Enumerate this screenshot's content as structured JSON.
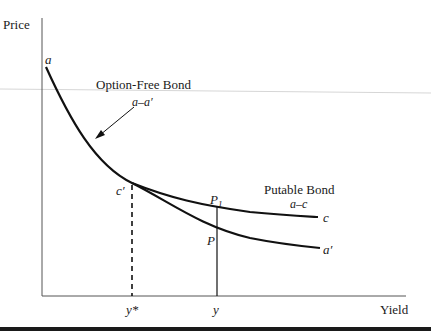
{
  "axes": {
    "y_label": "Price",
    "x_label": "Yield"
  },
  "points": {
    "a": "a",
    "a_prime": "a′",
    "c": "c",
    "c_prime": "c′",
    "p1_main": "P",
    "p1_sub": "1",
    "p": "P",
    "y_star": "y*",
    "y": "y"
  },
  "labels": {
    "option_free_title": "Option-Free Bond",
    "option_free_range": "a–a′",
    "putable_title": "Putable Bond",
    "putable_range": "a–c"
  },
  "colors": {
    "curve": "#111111",
    "axis": "#555555",
    "rule": "#1a1a1a",
    "guide": "#cccccc"
  }
}
